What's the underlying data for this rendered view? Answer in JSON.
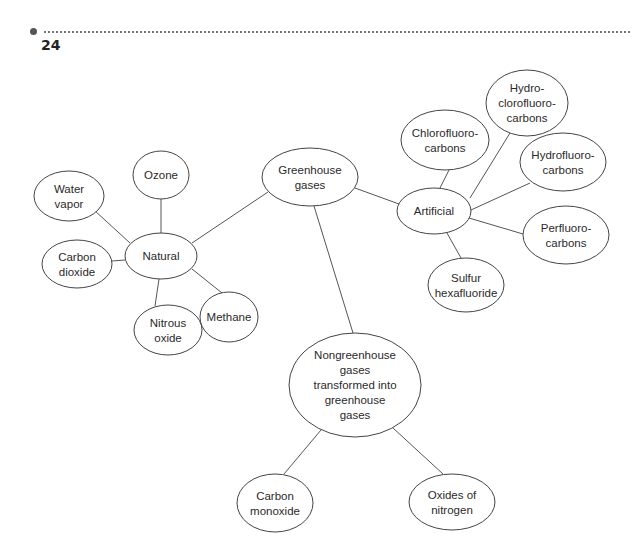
{
  "header": {
    "page_number": "24"
  },
  "diagram": {
    "type": "concept-map",
    "root": "greenhouse",
    "nodes": [
      {
        "id": "greenhouse",
        "lines": [
          "Greenhouse",
          "gases"
        ],
        "cx": 310,
        "cy": 177,
        "rx": 48,
        "ry": 29
      },
      {
        "id": "natural",
        "lines": [
          "Natural"
        ],
        "cx": 161,
        "cy": 256,
        "rx": 36,
        "ry": 23
      },
      {
        "id": "ozone",
        "lines": [
          "Ozone"
        ],
        "cx": 161,
        "cy": 175,
        "rx": 28,
        "ry": 24
      },
      {
        "id": "water",
        "lines": [
          "Water",
          "vapor"
        ],
        "cx": 69,
        "cy": 196,
        "rx": 35,
        "ry": 25
      },
      {
        "id": "co2",
        "lines": [
          "Carbon",
          "dioxide"
        ],
        "cx": 77,
        "cy": 264,
        "rx": 35,
        "ry": 24
      },
      {
        "id": "n2o",
        "lines": [
          "Nitrous",
          "oxide"
        ],
        "cx": 168,
        "cy": 330,
        "rx": 34,
        "ry": 25
      },
      {
        "id": "methane",
        "lines": [
          "Methane"
        ],
        "cx": 229,
        "cy": 317,
        "rx": 29,
        "ry": 25
      },
      {
        "id": "artificial",
        "lines": [
          "Artificial"
        ],
        "cx": 434,
        "cy": 211,
        "rx": 37,
        "ry": 23
      },
      {
        "id": "cfc",
        "lines": [
          "Chlorofluoro-",
          "carbons"
        ],
        "cx": 445,
        "cy": 140,
        "rx": 44,
        "ry": 30
      },
      {
        "id": "hcfc",
        "lines": [
          "Hydro-",
          "clorofluoro-",
          "carbons"
        ],
        "cx": 527,
        "cy": 103,
        "rx": 41,
        "ry": 33
      },
      {
        "id": "hfc",
        "lines": [
          "Hydrofluoro-",
          "carbons"
        ],
        "cx": 563,
        "cy": 162,
        "rx": 43,
        "ry": 29
      },
      {
        "id": "pfc",
        "lines": [
          "Perfluoro-",
          "carbons"
        ],
        "cx": 566,
        "cy": 235,
        "rx": 43,
        "ry": 29
      },
      {
        "id": "sf6",
        "lines": [
          "Sulfur",
          "hexafluoride"
        ],
        "cx": 466,
        "cy": 285,
        "rx": 38,
        "ry": 27
      },
      {
        "id": "nongreen",
        "lines": [
          "Nongreenhouse",
          "gases",
          "transformed into",
          "greenhouse",
          "gases"
        ],
        "cx": 355,
        "cy": 385,
        "rx": 66,
        "ry": 52
      },
      {
        "id": "co",
        "lines": [
          "Carbon",
          "monoxide"
        ],
        "cx": 275,
        "cy": 503,
        "rx": 38,
        "ry": 29
      },
      {
        "id": "nox",
        "lines": [
          "Oxides of",
          "nitrogen"
        ],
        "cx": 452,
        "cy": 502,
        "rx": 43,
        "ry": 28
      }
    ],
    "edges": [
      {
        "from": "greenhouse",
        "to": "natural",
        "x1": 268,
        "y1": 192,
        "x2": 192,
        "y2": 243
      },
      {
        "from": "greenhouse",
        "to": "artificial",
        "x1": 355,
        "y1": 188,
        "x2": 399,
        "y2": 204
      },
      {
        "from": "greenhouse",
        "to": "nongreen",
        "x1": 314,
        "y1": 206,
        "x2": 353,
        "y2": 333
      },
      {
        "from": "natural",
        "to": "ozone",
        "x1": 161,
        "y1": 233,
        "x2": 161,
        "y2": 199
      },
      {
        "from": "natural",
        "to": "water",
        "x1": 130,
        "y1": 243,
        "x2": 94,
        "y2": 210
      },
      {
        "from": "natural",
        "to": "co2",
        "x1": 125,
        "y1": 260,
        "x2": 112,
        "y2": 261
      },
      {
        "from": "natural",
        "to": "n2o",
        "x1": 159,
        "y1": 279,
        "x2": 155,
        "y2": 306
      },
      {
        "from": "natural",
        "to": "methane",
        "x1": 192,
        "y1": 269,
        "x2": 222,
        "y2": 293
      },
      {
        "from": "artificial",
        "to": "cfc",
        "x1": 440,
        "y1": 188,
        "x2": 449,
        "y2": 170
      },
      {
        "from": "artificial",
        "to": "hcfc",
        "x1": 470,
        "y1": 198,
        "x2": 510,
        "y2": 133
      },
      {
        "from": "artificial",
        "to": "hfc",
        "x1": 471,
        "y1": 210,
        "x2": 530,
        "y2": 183
      },
      {
        "from": "artificial",
        "to": "pfc",
        "x1": 469,
        "y1": 218,
        "x2": 523,
        "y2": 234
      },
      {
        "from": "artificial",
        "to": "sf6",
        "x1": 447,
        "y1": 233,
        "x2": 461,
        "y2": 258
      },
      {
        "from": "nongreen",
        "to": "co",
        "x1": 321,
        "y1": 430,
        "x2": 284,
        "y2": 474
      },
      {
        "from": "nongreen",
        "to": "nox",
        "x1": 393,
        "y1": 428,
        "x2": 443,
        "y2": 474
      }
    ]
  },
  "colors": {
    "stroke": "#444444",
    "edge": "#555555",
    "text": "#2a2a2a",
    "background": "#ffffff"
  }
}
